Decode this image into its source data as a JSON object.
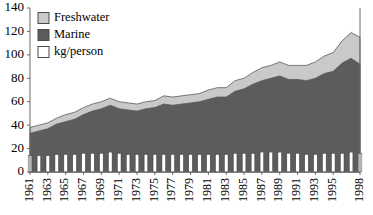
{
  "chart_data": {
    "type": "area",
    "title": "",
    "xlabel": "",
    "ylabel": "",
    "ylim": [
      0,
      140
    ],
    "ytick_values": [
      0,
      20,
      40,
      60,
      80,
      100,
      120,
      140
    ],
    "ytick_labels": [
      "0",
      "20",
      "40",
      "60",
      "80",
      "100",
      "120",
      "140"
    ],
    "grid": false,
    "legend_position": "top-left",
    "x": [
      1961,
      1962,
      1963,
      1964,
      1965,
      1966,
      1967,
      1968,
      1969,
      1970,
      1971,
      1972,
      1973,
      1974,
      1975,
      1976,
      1977,
      1978,
      1979,
      1980,
      1981,
      1982,
      1983,
      1984,
      1985,
      1986,
      1987,
      1988,
      1989,
      1990,
      1991,
      1992,
      1993,
      1994,
      1995,
      1996,
      1997,
      1998
    ],
    "xtick_labels": [
      "1961",
      "1963",
      "1965",
      "1967",
      "1969",
      "1971",
      "1973",
      "1975",
      "1977",
      "1979",
      "1981",
      "1983",
      "1985",
      "1987",
      "1989",
      "1991",
      "1993",
      "1995",
      "1998"
    ],
    "xtick_years": [
      1961,
      1963,
      1965,
      1967,
      1969,
      1971,
      1973,
      1975,
      1977,
      1979,
      1981,
      1983,
      1985,
      1987,
      1989,
      1991,
      1993,
      1995,
      1998
    ],
    "series": [
      {
        "name": "Marine",
        "kind": "area-stacked",
        "color": "#5c5c5c",
        "values": [
          33,
          35,
          37,
          41,
          43,
          45,
          49,
          52,
          54,
          57,
          54,
          53,
          52,
          54,
          55,
          58,
          57,
          58,
          59,
          60,
          62,
          64,
          64,
          69,
          71,
          75,
          78,
          80,
          82,
          79,
          79,
          78,
          80,
          84,
          86,
          93,
          97,
          92
        ]
      },
      {
        "name": "Freshwater",
        "kind": "area-stacked",
        "color": "#c9c9c9",
        "values": [
          5,
          5,
          5,
          5,
          6,
          6,
          6,
          6,
          6,
          6,
          6,
          6,
          6,
          6,
          6,
          7,
          7,
          7,
          7,
          7,
          8,
          8,
          8,
          9,
          9,
          10,
          11,
          11,
          12,
          12,
          12,
          13,
          14,
          15,
          16,
          19,
          22,
          23
        ]
      },
      {
        "name": "kg/person",
        "kind": "bar",
        "color": "#ffffff",
        "values": [
          14,
          14,
          14,
          15,
          15,
          15,
          16,
          16,
          16,
          17,
          16,
          15,
          15,
          15,
          15,
          15,
          15,
          15,
          15,
          15,
          15,
          15,
          15,
          16,
          16,
          16,
          17,
          17,
          17,
          16,
          16,
          15,
          15,
          16,
          16,
          16,
          17,
          16
        ]
      }
    ],
    "legend": [
      {
        "label": "Freshwater",
        "color": "#c9c9c9"
      },
      {
        "label": "Marine",
        "color": "#5c5c5c"
      },
      {
        "label": "kg/person",
        "color": "#ffffff"
      }
    ]
  }
}
